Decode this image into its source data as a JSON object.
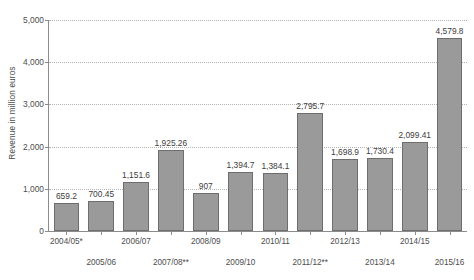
{
  "chart_data": {
    "type": "bar",
    "title": "",
    "subtitle": "",
    "xlabel": "",
    "ylabel": "Revenue in million euros",
    "ylim": [
      0,
      5000
    ],
    "ytick_labels": [
      "0",
      "1,000",
      "2,000",
      "3,000",
      "4,000",
      "5,000"
    ],
    "ytick_values": [
      0,
      1000,
      2000,
      3000,
      4000,
      5000
    ],
    "grid": true,
    "legend": false,
    "legend_position": "none",
    "categories": [
      "2004/05*",
      "2005/06",
      "2006/07",
      "2007/08**",
      "2008/09",
      "2009/10",
      "2010/11",
      "2011/12**",
      "2012/13",
      "2013/14",
      "2014/15",
      "2015/16"
    ],
    "values": [
      659.2,
      700.45,
      1151.6,
      1925.26,
      907,
      1394.7,
      1384.1,
      2795.7,
      1698.9,
      1730.4,
      2099.41,
      4579.8
    ],
    "value_labels": [
      "659.2",
      "700.45",
      "1,151.6",
      "1,925.26",
      "907",
      "1,394.7",
      "1,384.1",
      "2,795.7",
      "1,698.9",
      "1,730.4",
      "2,099.41",
      "4,579.8"
    ],
    "bar_color": "#9a9a9a",
    "bar_border_color": "#6e6e6e",
    "gridline_color": "#b4b4b4",
    "axis_color": "#8c8c8c",
    "text_color": "#4d4d4d",
    "background_color": "#ffffff"
  }
}
